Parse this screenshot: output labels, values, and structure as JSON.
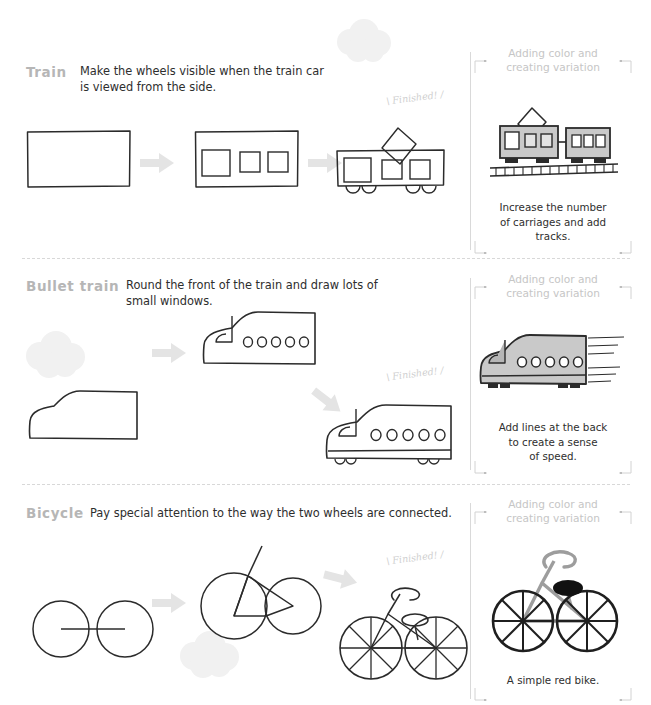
{
  "page": {
    "title": "How to draw vehicles worksheet",
    "background": "#ffffff",
    "ink_color": "#2b2b2b",
    "muted_color": "#b6b6b6",
    "arrow_color": "#e2e2e2",
    "cloud_color": "#f2f2f2",
    "fill_gray": "#c9c9c9"
  },
  "finished_label": "Finished!",
  "variation_panel_title": "Adding color and\ncreating variation",
  "sections": [
    {
      "id": "train",
      "title": "Train",
      "description": "Make the wheels visible when the train car\nis viewed from the side.",
      "steps": [
        {
          "index": 1,
          "name": "plain-rectangle-body"
        },
        {
          "index": 2,
          "name": "body-with-windows"
        },
        {
          "index": 3,
          "name": "train-with-wheels-and-pantograph"
        }
      ],
      "panel": {
        "caption": "Increase the number\nof carriages and add\ntracks.",
        "art_name": "gray-train-two-carriages-on-track"
      }
    },
    {
      "id": "bullet-train",
      "title": "Bullet train",
      "description": "Round the front of the train and draw lots of\nsmall windows.",
      "steps": [
        {
          "index": 1,
          "name": "rounded-nose-body"
        },
        {
          "index": 2,
          "name": "body-with-cockpit-and-windows"
        },
        {
          "index": 3,
          "name": "bullet-train-with-wheels"
        }
      ],
      "panel": {
        "caption": "Add lines at the back\nto create a sense\nof speed.",
        "art_name": "gray-bullet-train-with-speed-lines"
      }
    },
    {
      "id": "bicycle",
      "title": "Bicycle",
      "description": "Pay special attention to the way the two wheels are connected.",
      "steps": [
        {
          "index": 1,
          "name": "two-wheels-with-axle"
        },
        {
          "index": 2,
          "name": "wheels-with-frame-and-seatpost"
        },
        {
          "index": 3,
          "name": "bicycle-with-spokes-handlebar-saddle"
        }
      ],
      "panel": {
        "caption": "A simple red bike.",
        "art_name": "gray-bicycle-with-black-saddle"
      }
    }
  ],
  "decorations": {
    "clouds": [
      {
        "name": "cloud-top-center"
      },
      {
        "name": "cloud-bullet-left"
      },
      {
        "name": "cloud-bicycle-center"
      }
    ],
    "arrows": [
      {
        "name": "step-arrow-1"
      },
      {
        "name": "step-arrow-2"
      }
    ]
  }
}
